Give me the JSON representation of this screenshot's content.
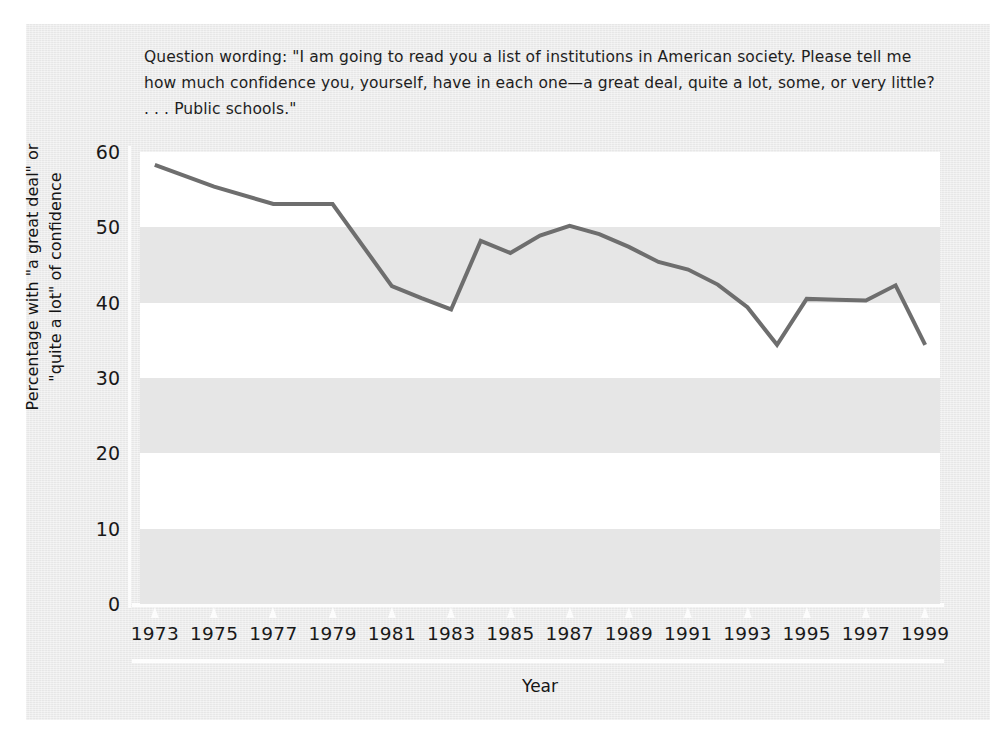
{
  "figure": {
    "question_wording": "Question wording: \"I am going to read you a list of institutions in American society. Please tell me how much confidence you, yourself, have in each one—a great deal, quite a lot, some, or very little? . . . Public schools.\"",
    "background_color": "#ececec",
    "plot_background_color": "#ffffff",
    "band_color": "#e6e6e6",
    "line_color": "#6e6e6e",
    "axis_color": "#fcfcfc",
    "text_color": "#191919"
  },
  "chart_data": {
    "type": "line",
    "title": "",
    "subtitle": "",
    "xlabel": "Year",
    "ylabel": "Percentage with \"a great deal\" or \"quite a lot\" of confidence",
    "ylabel_line1": "Percentage with \"a great deal\" or",
    "ylabel_line2": "\"quite a lot\" of confidence",
    "xlim": [
      1972.5,
      1999.5
    ],
    "ylim": [
      0,
      60
    ],
    "yticks": [
      0,
      10,
      20,
      30,
      40,
      50,
      60
    ],
    "ytick_labels": [
      "0",
      "10",
      "20",
      "30",
      "40",
      "50",
      "60"
    ],
    "xticks": [
      1973,
      1975,
      1977,
      1979,
      1981,
      1983,
      1985,
      1987,
      1989,
      1991,
      1993,
      1995,
      1997,
      1999
    ],
    "xtick_labels": [
      "1973",
      "1975",
      "1977",
      "1979",
      "1981",
      "1983",
      "1985",
      "1987",
      "1989",
      "1991",
      "1993",
      "1995",
      "1997",
      "1999"
    ],
    "grid": "alternating horizontal bands every 10 units",
    "legend": "none",
    "x": [
      1973,
      1975,
      1977,
      1979,
      1981,
      1982,
      1983,
      1984,
      1985,
      1986,
      1987,
      1988,
      1989,
      1990,
      1991,
      1992,
      1993,
      1994,
      1995,
      1996,
      1997,
      1998,
      1999
    ],
    "values": [
      58.3,
      55.4,
      53.1,
      53.1,
      42.2,
      40.6,
      39.1,
      48.2,
      46.6,
      48.9,
      50.2,
      49.1,
      47.4,
      45.4,
      44.4,
      42.4,
      39.4,
      34.4,
      40.5,
      40.4,
      40.3,
      42.3,
      34.4
    ],
    "series": [
      {
        "name": "Confidence in public schools",
        "values": [
          58.3,
          55.4,
          53.1,
          53.1,
          42.2,
          40.6,
          39.1,
          48.2,
          46.6,
          48.9,
          50.2,
          49.1,
          47.4,
          45.4,
          44.4,
          42.4,
          39.4,
          34.4,
          40.5,
          40.4,
          40.3,
          42.3,
          34.4
        ]
      }
    ]
  }
}
